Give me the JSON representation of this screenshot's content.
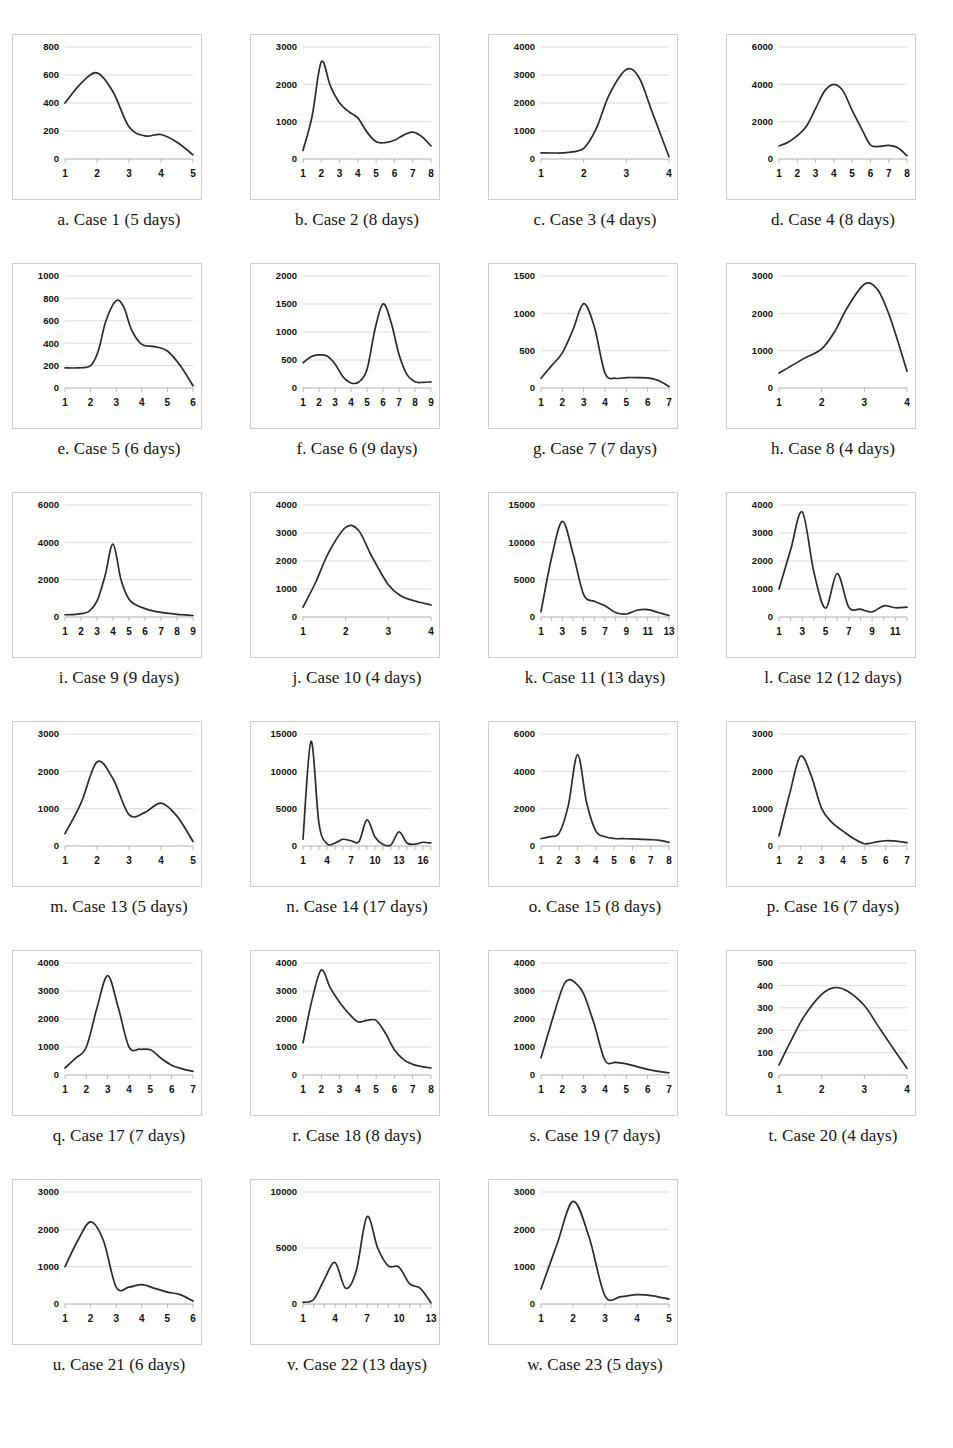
{
  "page": {
    "background": "#ffffff",
    "line_color": "#2b2b2b",
    "grid_color": "#cccccc",
    "panel_border_color": "#cfcfcf",
    "columns": 4
  },
  "chart_data": [
    {
      "type": "line",
      "title": "a. Case 1 (5 days)",
      "caption_letter": "a.",
      "case_name": "Case 1",
      "duration": "5 days",
      "xlabel": "",
      "ylabel": "",
      "ylim": [
        0,
        800
      ],
      "yticks": [
        0,
        200,
        400,
        600,
        800
      ],
      "xticks": [
        1,
        2,
        3,
        4,
        5
      ],
      "x": [
        1,
        1.5,
        2,
        2.5,
        3,
        3.5,
        4,
        4.5,
        5
      ],
      "values": [
        400,
        540,
        615,
        480,
        230,
        165,
        175,
        120,
        30
      ],
      "grid": true
    },
    {
      "type": "line",
      "title": "b. Case 2 (8 days)",
      "caption_letter": "b.",
      "case_name": "Case 2",
      "duration": "8 days",
      "xlabel": "",
      "ylabel": "",
      "ylim": [
        0,
        3000
      ],
      "yticks": [
        0,
        1000,
        2000,
        3000
      ],
      "xticks": [
        1,
        2,
        3,
        4,
        5,
        6,
        7,
        8
      ],
      "x": [
        1,
        1.5,
        2,
        2.5,
        3,
        3.5,
        4,
        4.5,
        5,
        5.5,
        6,
        6.5,
        7,
        7.5,
        8
      ],
      "values": [
        230,
        1150,
        2600,
        1950,
        1500,
        1270,
        1100,
        720,
        460,
        440,
        500,
        640,
        720,
        600,
        350
      ],
      "grid": true
    },
    {
      "type": "line",
      "title": "c. Case 3 (4 days)",
      "caption_letter": "c.",
      "case_name": "Case 3",
      "duration": "4 days",
      "xlabel": "",
      "ylabel": "",
      "ylim": [
        0,
        4000
      ],
      "yticks": [
        0,
        1000,
        2000,
        3000,
        4000
      ],
      "xticks": [
        1,
        2,
        3,
        4
      ],
      "x": [
        1,
        1.3,
        1.6,
        2,
        2.3,
        2.6,
        3,
        3.3,
        3.6,
        4
      ],
      "values": [
        220,
        215,
        230,
        380,
        1100,
        2300,
        3200,
        2900,
        1700,
        80
      ],
      "grid": true
    },
    {
      "type": "line",
      "title": "d. Case 4 (8 days)",
      "caption_letter": "d.",
      "case_name": "Case 4",
      "duration": "8 days",
      "xlabel": "",
      "ylabel": "",
      "ylim": [
        0,
        6000
      ],
      "yticks": [
        0,
        2000,
        4000,
        6000
      ],
      "xticks": [
        1,
        2,
        3,
        4,
        5,
        6,
        7,
        8
      ],
      "x": [
        1,
        1.5,
        2,
        2.5,
        3,
        3.5,
        4,
        4.5,
        5,
        5.5,
        6,
        6.5,
        7,
        7.5,
        8
      ],
      "values": [
        700,
        900,
        1250,
        1750,
        2700,
        3650,
        4000,
        3650,
        2600,
        1650,
        750,
        680,
        730,
        600,
        180
      ],
      "grid": true
    },
    {
      "type": "line",
      "title": "e. Case 5 (6 days)",
      "caption_letter": "e.",
      "case_name": "Case 5",
      "duration": "6 days",
      "xlabel": "",
      "ylabel": "",
      "ylim": [
        0,
        1000
      ],
      "yticks": [
        0,
        200,
        400,
        600,
        800,
        1000
      ],
      "xticks": [
        1,
        2,
        3,
        4,
        5,
        6
      ],
      "x": [
        1,
        1.5,
        2,
        2.3,
        2.6,
        3,
        3.3,
        3.6,
        4,
        4.5,
        5,
        5.5,
        6
      ],
      "values": [
        180,
        180,
        200,
        330,
        600,
        780,
        720,
        520,
        390,
        370,
        330,
        200,
        20
      ],
      "grid": true
    },
    {
      "type": "line",
      "title": "f. Case 6 (9 days)",
      "caption_letter": "f.",
      "case_name": "Case 6",
      "duration": "9 days",
      "xlabel": "",
      "ylabel": "",
      "ylim": [
        0,
        2000
      ],
      "yticks": [
        0,
        500,
        1000,
        1500,
        2000
      ],
      "xticks": [
        1,
        2,
        3,
        4,
        5,
        6,
        7,
        8,
        9
      ],
      "x": [
        1,
        1.5,
        2,
        2.5,
        3,
        3.5,
        4,
        4.5,
        5,
        5.5,
        6,
        6.5,
        7,
        7.5,
        8,
        8.5,
        9
      ],
      "values": [
        450,
        560,
        590,
        570,
        430,
        200,
        90,
        110,
        330,
        1050,
        1500,
        1180,
        600,
        240,
        110,
        100,
        110
      ],
      "grid": true
    },
    {
      "type": "line",
      "title": "g. Case 7 (7 days)",
      "caption_letter": "g.",
      "case_name": "Case 7",
      "duration": "7 days",
      "xlabel": "",
      "ylabel": "",
      "ylim": [
        0,
        1500
      ],
      "yticks": [
        0,
        500,
        1000,
        1500
      ],
      "xticks": [
        1,
        2,
        3,
        4,
        5,
        6,
        7
      ],
      "x": [
        1,
        1.5,
        2,
        2.5,
        3,
        3.5,
        4,
        4.5,
        5,
        5.5,
        6,
        6.5,
        7
      ],
      "values": [
        130,
        300,
        470,
        780,
        1130,
        820,
        200,
        130,
        140,
        140,
        135,
        100,
        20
      ],
      "grid": true
    },
    {
      "type": "line",
      "title": "h. Case 8 (4 days)",
      "caption_letter": "h.",
      "case_name": "Case 8",
      "duration": "4 days",
      "xlabel": "",
      "ylabel": "",
      "ylim": [
        0,
        3000
      ],
      "yticks": [
        0,
        1000,
        2000,
        3000
      ],
      "xticks": [
        1,
        2,
        3,
        4
      ],
      "x": [
        1,
        1.3,
        1.6,
        2,
        2.3,
        2.6,
        3,
        3.3,
        3.6,
        4
      ],
      "values": [
        400,
        600,
        800,
        1050,
        1500,
        2150,
        2780,
        2650,
        1900,
        450
      ],
      "grid": true
    },
    {
      "type": "line",
      "title": "i. Case 9 (9 days)",
      "caption_letter": "i.",
      "case_name": "Case 9",
      "duration": "9 days",
      "xlabel": "",
      "ylabel": "",
      "ylim": [
        0,
        6000
      ],
      "yticks": [
        0,
        2000,
        4000,
        6000
      ],
      "xticks": [
        1,
        2,
        3,
        4,
        5,
        6,
        7,
        8,
        9
      ],
      "x": [
        1,
        1.5,
        2,
        2.5,
        3,
        3.5,
        4,
        4.5,
        5,
        5.5,
        6,
        6.5,
        7,
        7.5,
        8,
        8.5,
        9
      ],
      "values": [
        120,
        130,
        180,
        300,
        850,
        2200,
        3900,
        2000,
        950,
        620,
        450,
        330,
        250,
        190,
        140,
        110,
        80
      ],
      "grid": true
    },
    {
      "type": "line",
      "title": "j. Case 10 (4 days)",
      "caption_letter": "j.",
      "case_name": "Case 10",
      "duration": "4 days",
      "xlabel": "",
      "ylabel": "",
      "ylim": [
        0,
        4000
      ],
      "yticks": [
        0,
        1000,
        2000,
        3000,
        4000
      ],
      "xticks": [
        1,
        2,
        3,
        4
      ],
      "x": [
        1,
        1.3,
        1.6,
        2,
        2.3,
        2.6,
        3,
        3.3,
        3.6,
        4
      ],
      "values": [
        350,
        1250,
        2300,
        3200,
        3100,
        2200,
        1150,
        750,
        580,
        430
      ],
      "grid": true
    },
    {
      "type": "line",
      "title": "k. Case 11 (13 days)",
      "caption_letter": "k.",
      "case_name": "Case 11",
      "duration": "13 days",
      "xlabel": "",
      "ylabel": "",
      "ylim": [
        0,
        15000
      ],
      "yticks": [
        0,
        5000,
        10000,
        15000
      ],
      "xticks": [
        1,
        3,
        5,
        7,
        9,
        11,
        13
      ],
      "x": [
        1,
        2,
        3,
        4,
        5,
        6,
        7,
        8,
        9,
        10,
        11,
        12,
        13
      ],
      "values": [
        700,
        8000,
        12800,
        8500,
        3000,
        2100,
        1500,
        600,
        400,
        900,
        1000,
        600,
        200
      ],
      "grid": true
    },
    {
      "type": "line",
      "title": "l. Case 12 (12 days)",
      "caption_letter": "l.",
      "case_name": "Case 12",
      "duration": "12 days",
      "xlabel": "",
      "ylabel": "",
      "ylim": [
        0,
        4000
      ],
      "yticks": [
        0,
        1000,
        2000,
        3000,
        4000
      ],
      "xticks": [
        1,
        3,
        5,
        7,
        9,
        11
      ],
      "x": [
        1,
        2,
        3,
        4,
        5,
        6,
        7,
        8,
        9,
        10,
        11,
        12
      ],
      "values": [
        1000,
        2400,
        3750,
        1600,
        320,
        1550,
        350,
        280,
        180,
        400,
        330,
        350
      ],
      "grid": true
    },
    {
      "type": "line",
      "title": "m. Case 13 (5 days)",
      "caption_letter": "m.",
      "case_name": "Case 13",
      "duration": "5 days",
      "xlabel": "",
      "ylabel": "",
      "ylim": [
        0,
        3000
      ],
      "yticks": [
        0,
        1000,
        2000,
        3000
      ],
      "xticks": [
        1,
        2,
        3,
        4,
        5
      ],
      "x": [
        1,
        1.5,
        2,
        2.5,
        3,
        3.5,
        4,
        4.5,
        5
      ],
      "values": [
        330,
        1150,
        2250,
        1800,
        840,
        900,
        1150,
        800,
        120
      ],
      "grid": true
    },
    {
      "type": "line",
      "title": "n. Case 14 (17 days)",
      "caption_letter": "n.",
      "case_name": "Case 14",
      "duration": "17 days",
      "xlabel": "",
      "ylabel": "",
      "ylim": [
        0,
        15000
      ],
      "yticks": [
        0,
        5000,
        10000,
        15000
      ],
      "xticks": [
        1,
        4,
        7,
        10,
        13,
        16
      ],
      "x": [
        1,
        2,
        3,
        4,
        5,
        6,
        7,
        8,
        9,
        10,
        11,
        12,
        13,
        14,
        15,
        16,
        17
      ],
      "values": [
        900,
        14000,
        3000,
        300,
        400,
        900,
        700,
        600,
        3500,
        1200,
        200,
        150,
        1900,
        400,
        250,
        500,
        400
      ],
      "grid": true
    },
    {
      "type": "line",
      "title": "o. Case 15 (8 days)",
      "caption_letter": "o.",
      "case_name": "Case 15",
      "duration": "8 days",
      "xlabel": "",
      "ylabel": "",
      "ylim": [
        0,
        6000
      ],
      "yticks": [
        0,
        2000,
        4000,
        6000
      ],
      "xticks": [
        1,
        2,
        3,
        4,
        5,
        6,
        7,
        8
      ],
      "x": [
        1,
        1.5,
        2,
        2.5,
        3,
        3.5,
        4,
        4.5,
        5,
        5.5,
        6,
        6.5,
        7,
        7.5,
        8
      ],
      "values": [
        400,
        500,
        700,
        2200,
        4900,
        2300,
        800,
        500,
        400,
        390,
        380,
        360,
        340,
        300,
        200
      ],
      "grid": true
    },
    {
      "type": "line",
      "title": "p. Case 16 (7 days)",
      "caption_letter": "p.",
      "case_name": "Case 16",
      "duration": "7 days",
      "xlabel": "",
      "ylabel": "",
      "ylim": [
        0,
        3000
      ],
      "yticks": [
        0,
        1000,
        2000,
        3000
      ],
      "xticks": [
        1,
        2,
        3,
        4,
        5,
        6,
        7
      ],
      "x": [
        1,
        1.5,
        2,
        2.5,
        3,
        3.5,
        4,
        4.5,
        5,
        5.5,
        6,
        6.5,
        7
      ],
      "values": [
        270,
        1400,
        2400,
        1900,
        1000,
        620,
        400,
        200,
        60,
        100,
        140,
        130,
        90
      ],
      "grid": true
    },
    {
      "type": "line",
      "title": "q. Case 17 (7 days)",
      "caption_letter": "q.",
      "case_name": "Case 17",
      "duration": "7 days",
      "xlabel": "",
      "ylabel": "",
      "ylim": [
        0,
        4000
      ],
      "yticks": [
        0,
        1000,
        2000,
        3000,
        4000
      ],
      "xticks": [
        1,
        2,
        3,
        4,
        5,
        6,
        7
      ],
      "x": [
        1,
        1.5,
        2,
        2.5,
        3,
        3.5,
        4,
        4.5,
        5,
        5.5,
        6,
        6.5,
        7
      ],
      "values": [
        250,
        600,
        1000,
        2400,
        3550,
        2400,
        1000,
        920,
        900,
        600,
        350,
        220,
        130
      ],
      "grid": true
    },
    {
      "type": "line",
      "title": "r. Case 18 (8 days)",
      "caption_letter": "r.",
      "case_name": "Case 18",
      "duration": "8 days",
      "xlabel": "",
      "ylabel": "",
      "ylim": [
        0,
        4000
      ],
      "yticks": [
        0,
        1000,
        2000,
        3000,
        4000
      ],
      "xticks": [
        1,
        2,
        3,
        4,
        5,
        6,
        7,
        8
      ],
      "x": [
        1,
        1.5,
        2,
        2.5,
        3,
        3.5,
        4,
        4.5,
        5,
        5.5,
        6,
        6.5,
        7,
        7.5,
        8
      ],
      "values": [
        1150,
        2700,
        3750,
        3100,
        2600,
        2200,
        1900,
        1950,
        1950,
        1500,
        900,
        550,
        380,
        300,
        250
      ],
      "grid": true
    },
    {
      "type": "line",
      "title": "s. Case 19 (7 days)",
      "caption_letter": "s.",
      "case_name": "Case 19",
      "duration": "7 days",
      "xlabel": "",
      "ylabel": "",
      "ylim": [
        0,
        4000
      ],
      "yticks": [
        0,
        1000,
        2000,
        3000,
        4000
      ],
      "xticks": [
        1,
        2,
        3,
        4,
        5,
        6,
        7
      ],
      "x": [
        1,
        1.5,
        2,
        2.3,
        2.6,
        3,
        3.5,
        4,
        4.5,
        5,
        5.5,
        6,
        6.5,
        7
      ],
      "values": [
        620,
        1900,
        3100,
        3400,
        3300,
        2900,
        1800,
        520,
        450,
        400,
        300,
        200,
        130,
        80
      ],
      "grid": true
    },
    {
      "type": "line",
      "title": "t. Case 20 (4 days)",
      "caption_letter": "t.",
      "case_name": "Case 20",
      "duration": "4 days",
      "xlabel": "",
      "ylabel": "",
      "ylim": [
        0,
        500
      ],
      "yticks": [
        0,
        100,
        200,
        300,
        400,
        500
      ],
      "xticks": [
        1,
        2,
        3,
        4
      ],
      "x": [
        1,
        1.3,
        1.6,
        2,
        2.3,
        2.6,
        3,
        3.3,
        3.6,
        4
      ],
      "values": [
        45,
        160,
        265,
        360,
        390,
        375,
        310,
        225,
        140,
        30
      ],
      "grid": true
    },
    {
      "type": "line",
      "title": "u. Case 21 (6 days)",
      "caption_letter": "u.",
      "case_name": "Case 21",
      "duration": "6 days",
      "xlabel": "",
      "ylabel": "",
      "ylim": [
        0,
        3000
      ],
      "yticks": [
        0,
        1000,
        2000,
        3000
      ],
      "xticks": [
        1,
        2,
        3,
        4,
        5,
        6
      ],
      "x": [
        1,
        1.5,
        2,
        2.5,
        3,
        3.5,
        4,
        4.5,
        5,
        5.5,
        6
      ],
      "values": [
        1000,
        1700,
        2200,
        1700,
        450,
        450,
        520,
        420,
        320,
        250,
        80
      ],
      "grid": true
    },
    {
      "type": "line",
      "title": "v. Case 22 (13 days)",
      "caption_letter": "v.",
      "case_name": "Case 22",
      "duration": "13 days",
      "xlabel": "",
      "ylabel": "",
      "ylim": [
        0,
        10000
      ],
      "yticks": [
        0,
        5000,
        10000
      ],
      "xticks": [
        1,
        4,
        7,
        10,
        13
      ],
      "x": [
        1,
        2,
        3,
        4,
        5,
        6,
        7,
        8,
        9,
        10,
        11,
        12,
        13
      ],
      "values": [
        150,
        400,
        2200,
        3700,
        1400,
        3000,
        7800,
        5000,
        3400,
        3300,
        1800,
        1400,
        100
      ],
      "grid": true
    },
    {
      "type": "line",
      "title": "w. Case 23 (5 days)",
      "caption_letter": "w.",
      "case_name": "Case 23",
      "duration": "5 days",
      "xlabel": "",
      "ylabel": "",
      "ylim": [
        0,
        3000
      ],
      "yticks": [
        0,
        1000,
        2000,
        3000
      ],
      "xticks": [
        1,
        2,
        3,
        4,
        5
      ],
      "x": [
        1,
        1.5,
        2,
        2.5,
        3,
        3.5,
        4,
        4.5,
        5
      ],
      "values": [
        400,
        1600,
        2750,
        1800,
        220,
        200,
        250,
        220,
        130
      ],
      "grid": true
    }
  ]
}
